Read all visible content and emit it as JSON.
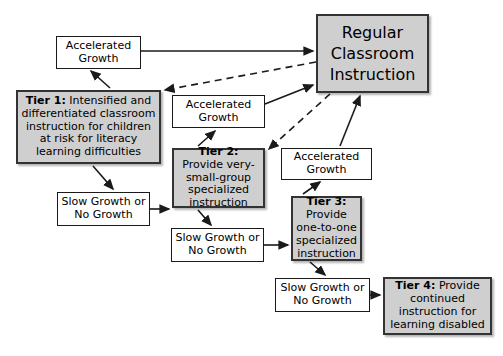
{
  "diagram": {
    "colors": {
      "tier_fill": "#cfcfcf",
      "plain_fill": "#ffffff",
      "stroke": "#1a1a1a",
      "background": "#ffffff"
    },
    "nodes": {
      "regular_classroom": {
        "text": "Regular Classroom Instruction",
        "style": "gray"
      },
      "accelerated_growth_1": {
        "text": "Accelerated Growth",
        "style": "white"
      },
      "accelerated_growth_2": {
        "text": "Accelerated Growth",
        "style": "white"
      },
      "accelerated_growth_3": {
        "text": "Accelerated Growth",
        "style": "white"
      },
      "slow_growth_1": {
        "text": "Slow Growth or No Growth",
        "style": "white"
      },
      "slow_growth_2": {
        "text": "Slow Growth or No Growth",
        "style": "white"
      },
      "slow_growth_3": {
        "text": "Slow Growth or No Growth",
        "style": "white"
      },
      "tier1": {
        "label": "Tier 1:",
        "body": " Intensified and differentiated classroom instruction for children at risk for literacy learning difficulties",
        "style": "gray"
      },
      "tier2": {
        "label": "Tier 2:",
        "body": " Provide very-small-group specialized instruction",
        "style": "gray"
      },
      "tier3": {
        "label": "Tier 3:",
        "body": " Provide one-to-one specialized instruction",
        "style": "gray"
      },
      "tier4": {
        "label": "Tier 4:",
        "body": " Provide continued instruction for learning disabled",
        "style": "gray"
      }
    },
    "edges": [
      {
        "from": "accelerated_growth_1",
        "to": "regular_classroom",
        "style": "solid"
      },
      {
        "from": "regular_classroom",
        "to": "tier1",
        "style": "dashed"
      },
      {
        "from": "tier1",
        "to": "accelerated_growth_1",
        "style": "solid"
      },
      {
        "from": "tier1",
        "to": "slow_growth_1",
        "style": "solid"
      },
      {
        "from": "slow_growth_1",
        "to": "tier2",
        "style": "solid"
      },
      {
        "from": "tier2",
        "to": "accelerated_growth_2",
        "style": "solid"
      },
      {
        "from": "accelerated_growth_2",
        "to": "regular_classroom",
        "style": "solid"
      },
      {
        "from": "regular_classroom",
        "to": "tier2",
        "style": "dashed"
      },
      {
        "from": "tier2",
        "to": "slow_growth_2",
        "style": "solid"
      },
      {
        "from": "slow_growth_2",
        "to": "tier3",
        "style": "solid"
      },
      {
        "from": "tier3",
        "to": "accelerated_growth_3",
        "style": "solid"
      },
      {
        "from": "accelerated_growth_3",
        "to": "regular_classroom",
        "style": "solid"
      },
      {
        "from": "tier3",
        "to": "slow_growth_3",
        "style": "solid"
      },
      {
        "from": "slow_growth_3",
        "to": "tier4",
        "style": "solid"
      }
    ]
  }
}
